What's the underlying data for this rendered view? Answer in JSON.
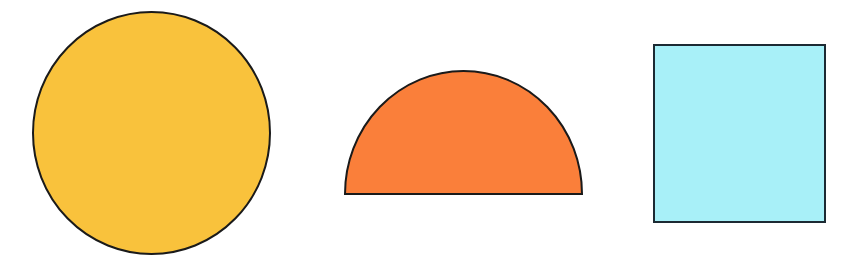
{
  "canvas": {
    "width": 867,
    "height": 264,
    "background": "#ffffff"
  },
  "shapes": [
    {
      "id": "circle",
      "label": "circle",
      "type": "ellipse",
      "cx": 151.5,
      "cy": 133,
      "rx": 118.5,
      "ry": 121,
      "fill": "#F9C23C",
      "stroke": "#1a1a1a",
      "stroke_width": 2
    },
    {
      "id": "semicircle",
      "label": "semicircle",
      "type": "semicircle",
      "x_left": 345,
      "x_right": 582,
      "base_y": 194,
      "top_y": 71,
      "fill": "#FA7F3A",
      "stroke": "#1a1a1a",
      "stroke_width": 2
    },
    {
      "id": "square",
      "label": "square",
      "type": "rect",
      "x": 654,
      "y": 45,
      "width": 171,
      "height": 177,
      "fill": "#A8F0F8",
      "stroke": "#1c2a33",
      "stroke_width": 2
    }
  ]
}
